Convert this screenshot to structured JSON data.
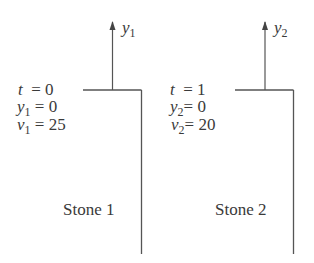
{
  "stones": [
    {
      "axis_var": "y",
      "axis_sub": "1",
      "t_label": "t",
      "t_value": "= 0",
      "y_var": "y",
      "y_sub": "1",
      "y_value": "= 0",
      "v_var": "v",
      "v_sub": "1",
      "v_value": "= 25",
      "name": "Stone 1"
    },
    {
      "axis_var": "y",
      "axis_sub": "2",
      "t_label": "t",
      "t_value": "= 1",
      "y_var": "y",
      "y_sub": "2",
      "y_value": "= 0",
      "v_var": "v",
      "v_sub": "2",
      "v_value": "= 20",
      "name": "Stone 2"
    }
  ],
  "colors": {
    "line": "#555555",
    "text": "#3a3a3a"
  }
}
